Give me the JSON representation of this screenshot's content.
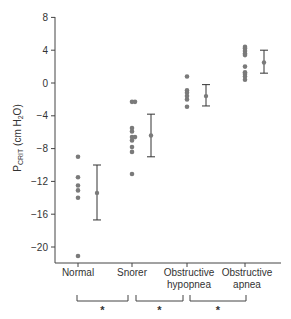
{
  "chart_data": {
    "type": "scatter",
    "title": "",
    "xlabel": "",
    "ylabel": "P_CRIT (cm H2O)",
    "ylabel_parts": {
      "main": "P",
      "sub": "CRIT",
      "unit_pre": " (cm H",
      "unit_sub": "2",
      "unit_post": "O)"
    },
    "ylim": [
      -22,
      8
    ],
    "yticks": [
      8,
      4,
      0,
      -4,
      -8,
      -12,
      -16,
      -20
    ],
    "categories": [
      "Normal",
      "Snorer",
      "Obstructive hypopnea",
      "Obstructive apnea"
    ],
    "category_label_lines": [
      [
        "Normal"
      ],
      [
        "Snorer"
      ],
      [
        "Obstructive",
        "hypopnea"
      ],
      [
        "Obstructive",
        "apnea"
      ]
    ],
    "grid": false,
    "legend": null,
    "series": [
      {
        "name": "Normal",
        "points": [
          -9.0,
          -11.5,
          -12.5,
          -13.1,
          -14.0,
          -21.1
        ],
        "mean": -13.4,
        "error_high": -10.0,
        "error_low": -16.7
      },
      {
        "name": "Snorer",
        "points": [
          -2.3,
          -2.3,
          -5.5,
          -5.9,
          -6.6,
          -6.6,
          -7.0,
          -7.8,
          -8.4,
          -11.1
        ],
        "mean": -6.4,
        "error_high": -3.8,
        "error_low": -9.0
      },
      {
        "name": "Obstructive hypopnea",
        "points": [
          0.8,
          -0.9,
          -1.2,
          -1.6,
          -2.0,
          -2.9
        ],
        "mean": -1.6,
        "error_high": -0.2,
        "error_low": -2.8
      },
      {
        "name": "Obstructive apnea",
        "points": [
          4.4,
          4.2,
          3.9,
          3.6,
          3.4,
          2.0,
          1.3,
          1.1,
          0.8,
          0.4
        ],
        "mean": 2.5,
        "error_high": 4.0,
        "error_low": 1.2
      }
    ],
    "annotations": [
      {
        "type": "significance",
        "from": "Normal",
        "to": "Snorer",
        "label": "*"
      },
      {
        "type": "significance",
        "from": "Snorer",
        "to": "Obstructive hypopnea",
        "label": "*"
      },
      {
        "type": "significance",
        "from": "Obstructive hypopnea",
        "to": "Obstructive apnea",
        "label": "*"
      }
    ]
  },
  "colors": {
    "points": "#7a7a7a",
    "axis": "#444444",
    "text": "#333333"
  }
}
